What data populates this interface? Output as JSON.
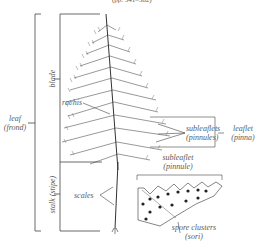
{
  "header": {
    "page_ref": "(pp. 541–562)"
  },
  "labels": {
    "blade": "blade",
    "stalk": "stalk (stipe)",
    "leaf_line1": "leaf",
    "leaf_line2": "(frond)",
    "rachis": "rachis",
    "subleaflets_line1": "subleaflets",
    "subleaflets_line2": "(pinnules)",
    "leaflet_line1": "leaflet",
    "leaflet_line2": "(pinna)",
    "subleaflet_line1": "subleaflet",
    "subleaflet_line2": "(pinnule)",
    "scales": "scales",
    "spore_line1": "spore clusters",
    "spore_line2": "(sori)"
  },
  "colors": {
    "ink": "#333333",
    "label": "#5a5a5a",
    "line": "#444444",
    "background": "#ffffff"
  }
}
